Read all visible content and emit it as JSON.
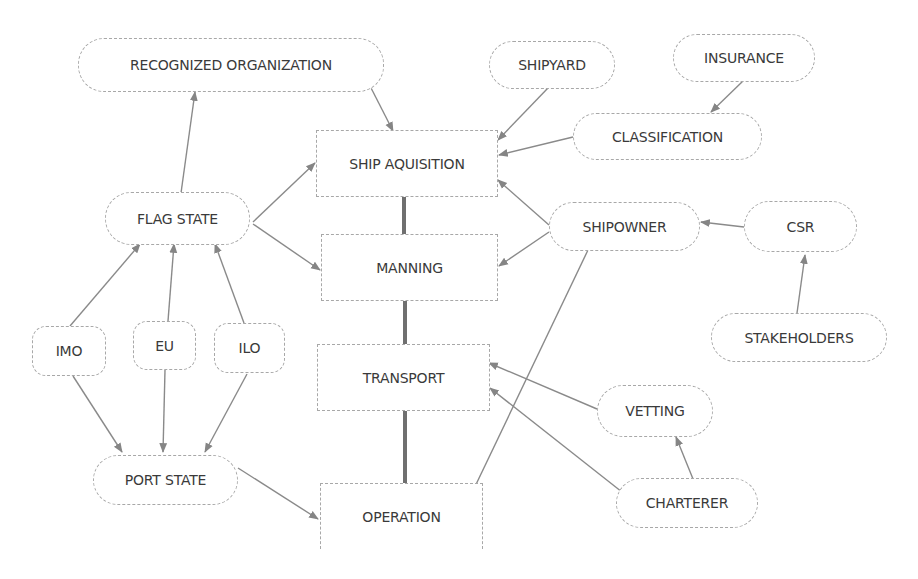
{
  "diagram": {
    "type": "flowchart",
    "colors": {
      "node_border": "#a8a8a8",
      "edge": "#8a8a8a",
      "spine": "#6f6f6f",
      "text": "#3a3a3a"
    },
    "nodes": {
      "recognized_organization": {
        "label": "RECOGNIZED ORGANIZATION",
        "shape": "pill"
      },
      "shipyard": {
        "label": "SHIPYARD",
        "shape": "pill"
      },
      "insurance": {
        "label": "INSURANCE",
        "shape": "pill"
      },
      "classification": {
        "label": "CLASSIFICATION",
        "shape": "pill"
      },
      "ship_aquisition": {
        "label": "SHIP AQUISITION",
        "shape": "rect"
      },
      "flag_state": {
        "label": "FLAG STATE",
        "shape": "pill"
      },
      "manning": {
        "label": "MANNING",
        "shape": "rect"
      },
      "shipowner": {
        "label": "SHIPOWNER",
        "shape": "pill"
      },
      "csr": {
        "label": "CSR",
        "shape": "pill"
      },
      "stakeholders": {
        "label": "STAKEHOLDERS",
        "shape": "pill"
      },
      "imo": {
        "label": "IMO",
        "shape": "rounded"
      },
      "eu": {
        "label": "EU",
        "shape": "rounded"
      },
      "ilo": {
        "label": "ILO",
        "shape": "rounded"
      },
      "transport": {
        "label": "TRANSPORT",
        "shape": "rect"
      },
      "vetting": {
        "label": "VETTING",
        "shape": "pill"
      },
      "port_state": {
        "label": "PORT STATE",
        "shape": "pill"
      },
      "charterer": {
        "label": "CHARTERER",
        "shape": "pill"
      },
      "operation": {
        "label": "OPERATION",
        "shape": "rect"
      }
    },
    "edges": [
      {
        "from": "flag_state",
        "to": "recognized_organization",
        "arrow": true
      },
      {
        "from": "recognized_organization",
        "to": "ship_aquisition",
        "arrow": true
      },
      {
        "from": "shipyard",
        "to": "ship_aquisition",
        "arrow": true
      },
      {
        "from": "insurance",
        "to": "classification",
        "arrow": true
      },
      {
        "from": "classification",
        "to": "ship_aquisition",
        "arrow": true
      },
      {
        "from": "flag_state",
        "to": "ship_aquisition",
        "arrow": true
      },
      {
        "from": "flag_state",
        "to": "manning",
        "arrow": true
      },
      {
        "from": "shipowner",
        "to": "ship_aquisition",
        "arrow": true
      },
      {
        "from": "shipowner",
        "to": "manning",
        "arrow": true
      },
      {
        "from": "shipowner",
        "to": "operation",
        "arrow": true
      },
      {
        "from": "csr",
        "to": "shipowner",
        "arrow": true
      },
      {
        "from": "stakeholders",
        "to": "csr",
        "arrow": true
      },
      {
        "from": "imo",
        "to": "flag_state",
        "arrow": true
      },
      {
        "from": "eu",
        "to": "flag_state",
        "arrow": true
      },
      {
        "from": "ilo",
        "to": "flag_state",
        "arrow": true
      },
      {
        "from": "imo",
        "to": "port_state",
        "arrow": true
      },
      {
        "from": "eu",
        "to": "port_state",
        "arrow": true
      },
      {
        "from": "ilo",
        "to": "port_state",
        "arrow": true
      },
      {
        "from": "port_state",
        "to": "operation",
        "arrow": true
      },
      {
        "from": "vetting",
        "to": "transport",
        "arrow": true
      },
      {
        "from": "charterer",
        "to": "transport",
        "arrow": true
      },
      {
        "from": "charterer",
        "to": "vetting",
        "arrow": true
      },
      {
        "from": "ship_aquisition",
        "to": "manning",
        "arrow": false,
        "style": "thick"
      },
      {
        "from": "manning",
        "to": "transport",
        "arrow": false,
        "style": "thick"
      },
      {
        "from": "transport",
        "to": "operation",
        "arrow": false,
        "style": "thick"
      }
    ]
  }
}
